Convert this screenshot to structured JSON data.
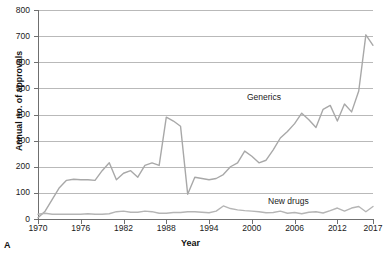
{
  "panel": {
    "letter": "A"
  },
  "axes": {
    "y_title": "Annual no. of approvals",
    "x_title": "Year",
    "y_ticks": [
      "0",
      "100",
      "200",
      "300",
      "400",
      "500",
      "600",
      "700",
      "800"
    ],
    "x_ticks": [
      "1970",
      "1976",
      "1982",
      "1988",
      "1994",
      "2000",
      "2006",
      "2012",
      "2017"
    ]
  },
  "series_labels": {
    "generics": "Generics",
    "new_drugs": "New drugs"
  },
  "colors": {
    "generics_line": "#a8a8a8",
    "new_drugs_line": "#b5b5b5",
    "grid": "#b9b9b9",
    "axis": "#6f6f6f",
    "text": "#1a1a1a"
  },
  "chart_data": {
    "type": "line",
    "title": "",
    "xlabel": "Year",
    "ylabel": "Annual no. of approvals",
    "xlim": [
      1970,
      2017
    ],
    "ylim": [
      0,
      800
    ],
    "yticks": [
      0,
      100,
      200,
      300,
      400,
      500,
      600,
      700,
      800
    ],
    "xticks": [
      1970,
      1976,
      1982,
      1988,
      1994,
      2000,
      2006,
      2012,
      2017
    ],
    "grid": "horizontal",
    "legend": "inline-labels",
    "x": [
      1970,
      1971,
      1972,
      1973,
      1974,
      1975,
      1976,
      1977,
      1978,
      1979,
      1980,
      1981,
      1982,
      1983,
      1984,
      1985,
      1986,
      1987,
      1988,
      1989,
      1990,
      1991,
      1992,
      1993,
      1994,
      1995,
      1996,
      1997,
      1998,
      1999,
      2000,
      2001,
      2002,
      2003,
      2004,
      2005,
      2006,
      2007,
      2008,
      2009,
      2010,
      2011,
      2012,
      2013,
      2014,
      2015,
      2016,
      2017
    ],
    "series": [
      {
        "name": "Generics",
        "values": [
          5,
          30,
          75,
          120,
          148,
          152,
          150,
          150,
          148,
          185,
          215,
          150,
          175,
          185,
          160,
          205,
          215,
          205,
          390,
          375,
          355,
          95,
          160,
          155,
          150,
          155,
          170,
          200,
          215,
          260,
          240,
          215,
          225,
          265,
          310,
          335,
          365,
          405,
          380,
          350,
          420,
          435,
          375,
          440,
          410,
          490,
          705,
          665
        ]
      },
      {
        "name": "New drugs",
        "values": [
          18,
          22,
          18,
          18,
          18,
          18,
          18,
          20,
          18,
          18,
          20,
          28,
          30,
          26,
          26,
          30,
          28,
          22,
          22,
          25,
          25,
          28,
          28,
          26,
          24,
          30,
          50,
          40,
          35,
          32,
          30,
          28,
          24,
          25,
          30,
          22,
          25,
          20,
          26,
          28,
          23,
          32,
          42,
          30,
          42,
          48,
          28,
          48
        ]
      }
    ]
  }
}
